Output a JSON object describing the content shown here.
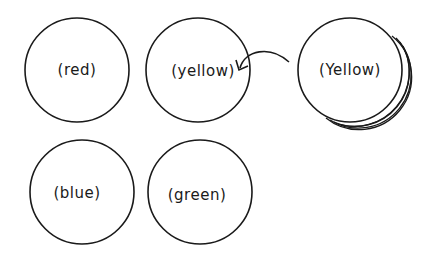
{
  "diagram": {
    "circles": [
      {
        "id": "red",
        "label": "(red)",
        "cx": 77,
        "cy": 70,
        "r": 52
      },
      {
        "id": "yellow-target",
        "label": "(yellow)",
        "cx": 198,
        "cy": 70,
        "r": 52
      },
      {
        "id": "yellow-moving",
        "label": "(Yellow)",
        "cx": 350,
        "cy": 70,
        "r": 52
      },
      {
        "id": "blue",
        "label": "(blue)",
        "cx": 82,
        "cy": 192,
        "r": 52
      },
      {
        "id": "green",
        "label": "(green)",
        "cx": 200,
        "cy": 192,
        "r": 52
      }
    ],
    "arrow": {
      "from": "yellow-moving",
      "to": "yellow-target"
    },
    "stroke_color": "#1a1a1a",
    "background": "#ffffff"
  }
}
